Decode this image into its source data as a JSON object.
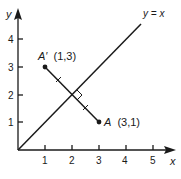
{
  "diagram": {
    "axes": {
      "x_label": "x",
      "y_label": "y",
      "x_ticks": [
        "1",
        "2",
        "3",
        "4",
        "5"
      ],
      "y_ticks": [
        "1",
        "2",
        "3",
        "4"
      ]
    },
    "line_label": "y = x",
    "points": {
      "A": {
        "name": "A",
        "coords": "(3,1)"
      },
      "A_prime": {
        "name": "A′",
        "coords": "(1,3)"
      }
    },
    "colors": {
      "ink": "#1a1a1a",
      "background": "#ffffff"
    }
  }
}
